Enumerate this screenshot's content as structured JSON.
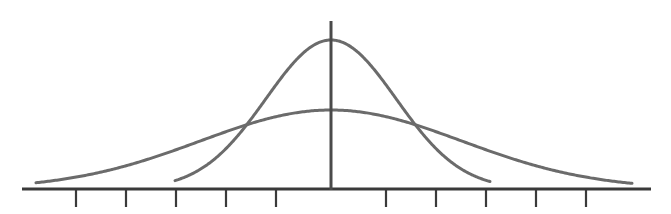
{
  "figure": {
    "caption": "",
    "background_color": "#ffffff",
    "width": 671,
    "height": 214
  },
  "style": {
    "curve_color": "#6b6b6b",
    "curve_width": 3.0,
    "axis_color": "#3c3c3c",
    "baseline_color": "#3a3a3a",
    "baseline_width": 3.2,
    "vertical_axis_color": "#4a4a4a",
    "vertical_axis_width": 3.0,
    "tick_color": "#3a3a3a",
    "tick_width": 2.2
  },
  "chart_data": {
    "type": "line",
    "title": "",
    "subtitle": "",
    "xlabel": "",
    "ylabel": "",
    "legend_position": "none",
    "grid": false,
    "axis": {
      "baseline_y_px": 189,
      "baseline_x_start_px": 22,
      "baseline_x_end_px": 651,
      "center_x_px": 331,
      "vertical_axis_top_px": 21,
      "vertical_axis_bottom_px": 190,
      "tick_length_px": 18,
      "tick_spacing_px": 50,
      "tick_count": 10,
      "tick_positions_px": [
        76,
        126,
        176,
        226,
        276,
        386,
        436,
        486,
        536,
        586
      ],
      "tick_labels": [
        "",
        "",
        "",
        "",
        "",
        "",
        "",
        "",
        "",
        ""
      ],
      "x_units_per_tick": 1,
      "xlim_units": [
        -6.1,
        6.4
      ],
      "ylim_units": [
        0,
        1.08
      ]
    },
    "series": [
      {
        "name": "narrow-tall-curve",
        "label": "Small standard deviation",
        "distribution": "normal",
        "mean_units": 0,
        "std_dev_units": 1.3,
        "peak_y_px": 40,
        "peak_height_px": 149,
        "baseline_contact_left_px": 175,
        "baseline_contact_right_px": 490,
        "color": "#6b6b6b"
      },
      {
        "name": "wide-flat-curve",
        "label": "Large standard deviation",
        "distribution": "normal",
        "mean_units": 0,
        "std_dev_units": 2.62,
        "peak_y_px": 110,
        "peak_height_px": 79,
        "baseline_contact_left_px": 36,
        "baseline_contact_right_px": 632,
        "color": "#6b6b6b"
      }
    ],
    "intersections_px": [
      {
        "x": 242,
        "y": 133
      },
      {
        "x": 418,
        "y": 132
      }
    ],
    "annotations": []
  }
}
